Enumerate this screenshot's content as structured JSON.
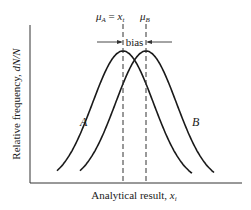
{
  "chart_data": {
    "type": "line",
    "title": "",
    "xlabel": "Analytical result, x_i",
    "ylabel": "Relative frequency, dN/N",
    "grid": false,
    "series": [
      {
        "name": "A",
        "distribution": "normal",
        "mean_label": "μ_A = x_t",
        "mean": 0,
        "sd": 1
      },
      {
        "name": "B",
        "distribution": "normal",
        "mean_label": "μ_B",
        "mean": 0.75,
        "sd": 1
      }
    ],
    "annotations": [
      "μ_A = x_t",
      "μ_B",
      "bias"
    ]
  },
  "labels": {
    "mu_a": "μ",
    "mu_a_sub": "A",
    "equals": " = ",
    "x_t": "x",
    "x_t_sub": "t",
    "mu_b": "μ",
    "mu_b_sub": "B",
    "bias": "bias",
    "curve_a": "A",
    "curve_b": "B",
    "xlabel_main": "Analytical result, ",
    "xlabel_var": "x",
    "xlabel_sub": "i",
    "ylabel_main": "Relative frequency, ",
    "ylabel_var": "dN/N"
  }
}
